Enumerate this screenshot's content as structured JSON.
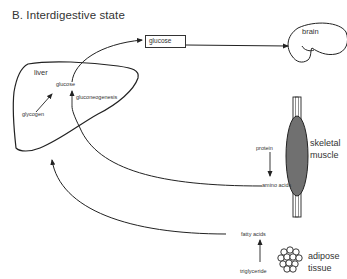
{
  "title": "B.  Interdigestive state",
  "organs": {
    "liver": "liver",
    "brain": "brain",
    "skeletal_muscle": [
      "skeletal",
      "muscle"
    ],
    "adipose_tissue": [
      "adipose",
      "tissue"
    ]
  },
  "metabolites": {
    "glucose_box": "glucose",
    "liver_glucose": "glucose",
    "glycogen": "glycogen",
    "gluconeogenesis": "gluconeogenesis",
    "protein": "protein",
    "amino_acids": "amino acids",
    "fatty_acids": "fatty acids",
    "triglyceride": "triglyceride"
  },
  "colors": {
    "line": "#222222",
    "muscle_fill": "#8a8a8a"
  }
}
